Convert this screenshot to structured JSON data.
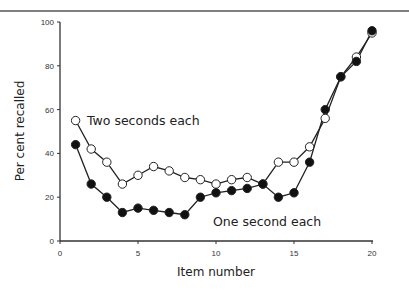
{
  "chart_data": {
    "type": "line",
    "title": "",
    "xlabel": "Item number",
    "ylabel": "Per cent recalled",
    "xlim": [
      0,
      20
    ],
    "ylim": [
      0,
      100
    ],
    "x_ticks": [
      0,
      5,
      10,
      15,
      20
    ],
    "y_ticks": [
      0,
      20,
      40,
      60,
      80,
      100
    ],
    "grid": false,
    "legend": "inline labels",
    "x": [
      1,
      2,
      3,
      4,
      5,
      6,
      7,
      8,
      9,
      10,
      11,
      12,
      13,
      14,
      15,
      16,
      17,
      18,
      19,
      20
    ],
    "series": [
      {
        "name": "Two seconds each",
        "marker": "open-circle",
        "values": [
          55,
          42,
          36,
          26,
          30,
          34,
          32,
          29,
          28,
          26,
          28,
          29,
          26,
          36,
          36,
          43,
          56,
          75,
          84,
          95
        ]
      },
      {
        "name": "One second each",
        "marker": "filled-circle",
        "values": [
          44,
          26,
          20,
          13,
          15,
          14,
          13,
          12,
          20,
          22,
          23,
          24,
          26,
          20,
          22,
          36,
          60,
          75,
          82,
          96
        ]
      }
    ],
    "annotations": [
      {
        "text": "Two seconds each",
        "x": 1.7,
        "y": 55
      },
      {
        "text": "One second each",
        "x": 9.4,
        "y": 8
      }
    ]
  }
}
